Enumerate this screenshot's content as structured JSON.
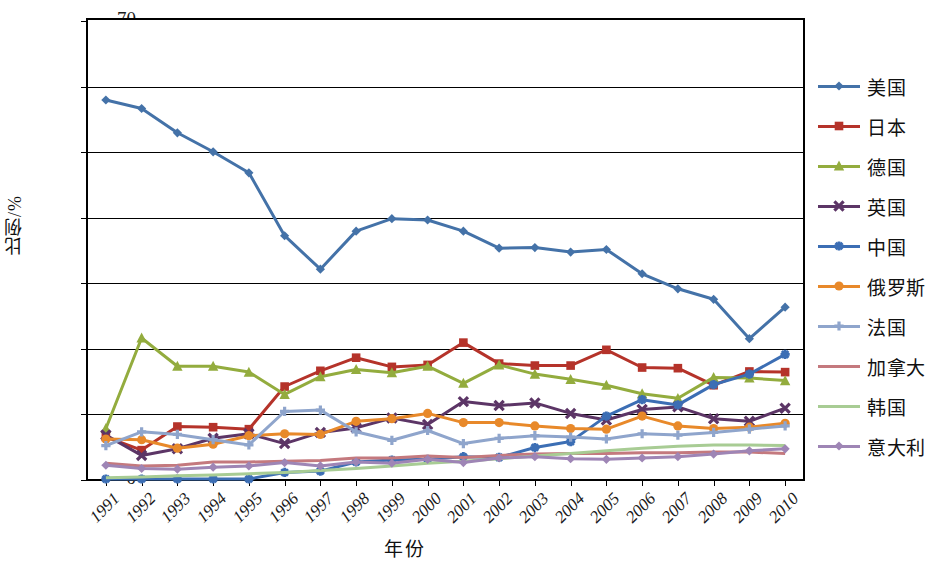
{
  "chart_data": {
    "type": "line",
    "title": "",
    "xlabel": "年份",
    "ylabel": "比例/%",
    "ylim": [
      0,
      70
    ],
    "yticks": [
      0,
      10,
      20,
      30,
      40,
      50,
      60,
      70
    ],
    "grid": true,
    "legend_position": "right",
    "categories": [
      "1991",
      "1992",
      "1993",
      "1994",
      "1995",
      "1996",
      "1997",
      "1998",
      "1999",
      "2000",
      "2001",
      "2002",
      "2003",
      "2004",
      "2005",
      "2006",
      "2007",
      "2008",
      "2009",
      "2010"
    ],
    "series": [
      {
        "name": "美国",
        "color": "#4472a8",
        "marker": "diamond",
        "values": [
          57.8,
          56.5,
          52.8,
          49.9,
          46.7,
          37.1,
          32.0,
          37.8,
          39.7,
          39.5,
          37.8,
          35.2,
          35.3,
          34.6,
          35.0,
          31.3,
          29.0,
          27.4,
          21.4,
          26.2
        ]
      },
      {
        "name": "日本",
        "color": "#b5332a",
        "marker": "square",
        "values": [
          6.4,
          4.4,
          8.0,
          7.9,
          7.6,
          14.1,
          16.5,
          18.5,
          17.1,
          17.4,
          20.8,
          17.6,
          17.3,
          17.3,
          19.7,
          17.0,
          16.9,
          14.3,
          16.4,
          16.3
        ]
      },
      {
        "name": "德国",
        "color": "#93ac3e",
        "marker": "triangle",
        "values": [
          7.7,
          21.5,
          17.2,
          17.2,
          16.3,
          12.9,
          15.6,
          16.7,
          16.2,
          17.2,
          14.6,
          17.4,
          16.0,
          15.2,
          14.3,
          13.0,
          12.3,
          15.5,
          15.4,
          15.0
        ]
      },
      {
        "name": "英国",
        "color": "#5c3566",
        "marker": "x",
        "values": [
          6.7,
          3.6,
          4.6,
          6.2,
          6.9,
          5.4,
          7.1,
          7.8,
          9.3,
          8.3,
          11.8,
          11.2,
          11.6,
          10.0,
          9.0,
          10.6,
          11.0,
          9.2,
          8.8,
          10.8
        ]
      },
      {
        "name": "中国",
        "color": "#3c6eb4",
        "marker": "star",
        "values": [
          0.0,
          0.0,
          0.0,
          0.0,
          0.0,
          1.0,
          1.2,
          2.6,
          2.9,
          3.0,
          3.4,
          3.3,
          4.8,
          5.7,
          9.6,
          12.1,
          11.3,
          14.4,
          16.0,
          19.0
        ]
      },
      {
        "name": "俄罗斯",
        "color": "#e8892a",
        "marker": "circle",
        "values": [
          6.1,
          6.0,
          4.7,
          5.3,
          6.6,
          6.9,
          6.8,
          8.8,
          9.2,
          10.0,
          8.6,
          8.6,
          8.1,
          7.7,
          7.6,
          9.6,
          8.1,
          7.7,
          7.9,
          8.5
        ]
      },
      {
        "name": "法国",
        "color": "#8fa5cc",
        "marker": "plus",
        "values": [
          5.1,
          7.2,
          6.8,
          6.0,
          5.2,
          10.3,
          10.5,
          7.2,
          5.9,
          7.4,
          5.4,
          6.2,
          6.6,
          6.4,
          6.1,
          6.9,
          6.7,
          7.1,
          7.6,
          8.1
        ]
      },
      {
        "name": "加拿大",
        "color": "#c4797e",
        "marker": "none",
        "values": [
          2.4,
          2.0,
          2.1,
          2.6,
          2.6,
          2.7,
          2.8,
          3.2,
          3.2,
          3.5,
          3.3,
          3.6,
          3.8,
          3.9,
          3.9,
          4.0,
          4.0,
          4.1,
          4.1,
          3.9
        ]
      },
      {
        "name": "韩国",
        "color": "#a8cc94",
        "marker": "none",
        "values": [
          0.2,
          0.3,
          0.5,
          0.6,
          0.8,
          1.0,
          1.3,
          1.6,
          2.0,
          2.4,
          2.7,
          3.1,
          3.5,
          3.9,
          4.3,
          4.7,
          5.0,
          5.2,
          5.2,
          5.1
        ]
      },
      {
        "name": "意大利",
        "color": "#9e85b5",
        "marker": "diamond",
        "values": [
          2.1,
          1.6,
          1.5,
          1.8,
          2.0,
          2.5,
          2.0,
          2.6,
          2.4,
          3.0,
          2.5,
          3.2,
          3.4,
          3.1,
          3.0,
          3.2,
          3.4,
          3.8,
          4.3,
          4.6
        ]
      }
    ]
  },
  "axis": {
    "y_title": "比例/%",
    "x_title": "年份",
    "y_tick_labels": [
      "70",
      "60",
      "50",
      "40",
      "30",
      "20",
      "10",
      "0"
    ],
    "x_tick_labels": [
      "1991",
      "1992",
      "1993",
      "1994",
      "1995",
      "1996",
      "1997",
      "1998",
      "1999",
      "2000",
      "2001",
      "2002",
      "2003",
      "2004",
      "2005",
      "2006",
      "2007",
      "2008",
      "2009",
      "2010"
    ]
  }
}
